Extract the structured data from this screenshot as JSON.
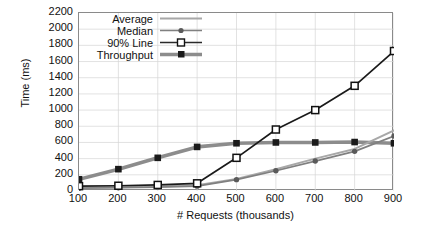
{
  "chart_data": {
    "type": "line",
    "title": "",
    "xlabel": "# Requests (thousands)",
    "ylabel": "Time (ms)",
    "x": [
      100,
      200,
      300,
      400,
      500,
      600,
      700,
      800,
      900
    ],
    "xlim": [
      100,
      900
    ],
    "ylim": [
      0,
      2200
    ],
    "yticks": [
      0,
      200,
      400,
      600,
      800,
      1000,
      1200,
      1400,
      1600,
      1800,
      2000,
      2200
    ],
    "xticks": [
      100,
      200,
      300,
      400,
      500,
      600,
      700,
      800,
      900
    ],
    "grid": true,
    "legend_position": "top-left-inside",
    "series": [
      {
        "name": "Average",
        "color": "#a8a8a8",
        "marker": "none",
        "values": [
          40,
          45,
          55,
          70,
          150,
          270,
          400,
          520,
          750
        ]
      },
      {
        "name": "Median",
        "color": "#808080",
        "marker": "circle",
        "values": [
          35,
          40,
          48,
          60,
          140,
          250,
          370,
          490,
          680
        ]
      },
      {
        "name": "90% Line",
        "color": "#1a1a1a",
        "marker": "open-square",
        "values": [
          60,
          65,
          75,
          95,
          410,
          760,
          1000,
          1300,
          1730
        ]
      },
      {
        "name": "Throughput",
        "color": "#8c8c8c",
        "marker": "filled-square",
        "values": [
          145,
          270,
          410,
          545,
          590,
          600,
          600,
          605,
          590
        ]
      }
    ]
  },
  "legend": {
    "items": [
      {
        "label": "Average"
      },
      {
        "label": "Median"
      },
      {
        "label": "90% Line"
      },
      {
        "label": "Throughput"
      }
    ]
  },
  "axes": {
    "y_tick_labels": [
      "2200",
      "2000",
      "1800",
      "1600",
      "1400",
      "1200",
      "1000",
      "800",
      "600",
      "400",
      "200",
      "0"
    ],
    "x_tick_labels": [
      "100",
      "200",
      "300",
      "400",
      "500",
      "600",
      "700",
      "800",
      "900"
    ]
  }
}
